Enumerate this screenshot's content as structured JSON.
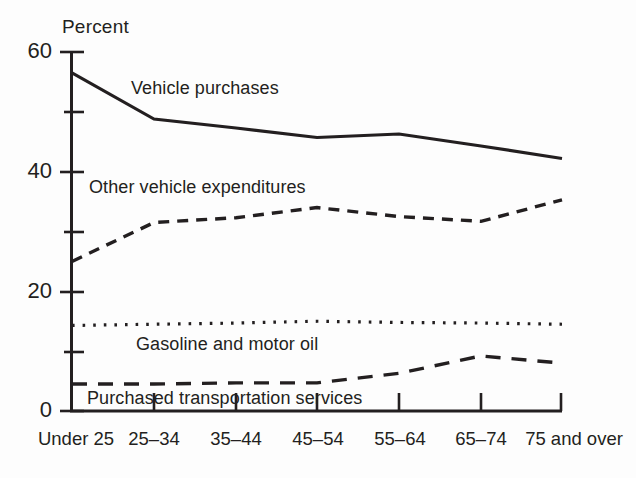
{
  "chart_data": {
    "type": "line",
    "title": "",
    "subtitle": "",
    "xlabel": "",
    "ylabel": "Percent",
    "ylim": [
      0,
      60
    ],
    "yticks": [
      0,
      20,
      40,
      60
    ],
    "yticks_minor": [
      10,
      30,
      50
    ],
    "grid": false,
    "legend_position": "inline-annotations",
    "categories": [
      "Under 25",
      "25–34",
      "35–44",
      "45–54",
      "55–64",
      "65–74",
      "75 and over"
    ],
    "series": [
      {
        "name": "Vehicle purchases",
        "style": "solid",
        "label_x_category": "25–34",
        "values": [
          56.5,
          48.8,
          47.3,
          45.7,
          46.3,
          44.3,
          42.2
        ]
      },
      {
        "name": "Other vehicle expenditures",
        "style": "dashed",
        "label_x_category": "25–34",
        "values": [
          25.0,
          31.5,
          32.3,
          34.0,
          32.5,
          31.7,
          35.3
        ]
      },
      {
        "name": "Gasoline and motor oil",
        "style": "dotted",
        "label_x_category": "35–44",
        "values": [
          14.3,
          14.5,
          14.7,
          15.0,
          14.8,
          14.7,
          14.5
        ]
      },
      {
        "name": "Purchased transportation services",
        "style": "dashed-long",
        "label_x_category": "35–44",
        "values": [
          4.5,
          4.5,
          4.7,
          4.7,
          6.3,
          9.2,
          8.0
        ]
      }
    ],
    "colors": {
      "line": "#231f20",
      "axis": "#231f20",
      "background": "#fdfdfd",
      "text": "#231f20"
    }
  },
  "axis": {
    "y_title": "Percent",
    "y_labels": [
      "60",
      "40",
      "20",
      "0"
    ],
    "x_labels": [
      "Under 25",
      "25–34",
      "35–44",
      "45–54",
      "55–64",
      "65–74",
      "75 and over"
    ]
  },
  "annotations": {
    "vehicle_purchases": "Vehicle purchases",
    "other_vehicle_expenditures": "Other vehicle expenditures",
    "gasoline_and_motor_oil": "Gasoline and motor oil",
    "purchased_transportation_services": "Purchased transportation services"
  }
}
